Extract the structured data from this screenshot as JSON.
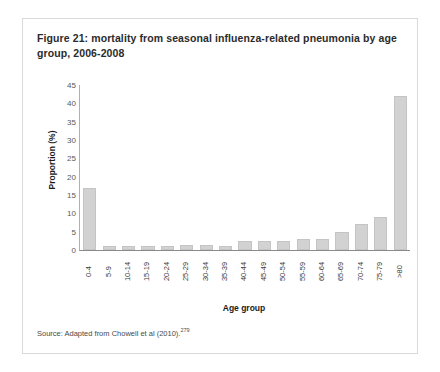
{
  "figure": {
    "title": "Figure 21: mortality from seasonal influenza-related pneumonia by age group, 2006-2008",
    "source_text": "Source: Adapted from Chowell et al (2010).",
    "source_superscript": "279"
  },
  "chart_data": {
    "type": "bar",
    "title": "",
    "xlabel": "Age group",
    "ylabel": "Proportion (%)",
    "ylim": [
      0,
      45
    ],
    "yticks": [
      0,
      5,
      10,
      15,
      20,
      25,
      30,
      35,
      40,
      45
    ],
    "grid": false,
    "legend": null,
    "bar_color": "#d2d2d2",
    "categories": [
      "0-4",
      "5-9",
      "10-14",
      "15-19",
      "20-24",
      "25-29",
      "30-34",
      "35-39",
      "40-44",
      "45-49",
      "50-54",
      "55-59",
      "60-64",
      "65-69",
      "70-74",
      "75-79",
      ">80"
    ],
    "values": [
      17,
      1,
      1,
      1,
      1,
      1.5,
      1.5,
      1,
      2.5,
      2.5,
      2.5,
      3,
      3,
      5,
      7,
      9,
      42
    ]
  }
}
